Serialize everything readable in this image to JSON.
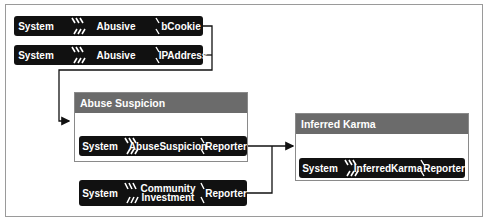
{
  "diagram": {
    "inputs": [
      {
        "context": "System",
        "claim": "Abusive",
        "target": "bCookie"
      },
      {
        "context": "System",
        "claim": "Abusive",
        "target": "IPAddress"
      }
    ],
    "groups": [
      {
        "title": "Abuse Suspicion",
        "block": {
          "context": "System",
          "claim": "AbuseSuspicion",
          "target": "Reporter"
        }
      },
      {
        "title": "Inferred Karma",
        "block": {
          "context": "System",
          "claim": "InferredKarma",
          "target": "Reporter"
        }
      }
    ],
    "community": {
      "context": "System",
      "claim_line1": "Community",
      "claim_line2": "Investment",
      "target": "Reporter"
    },
    "colors": {
      "block": "#111111",
      "header": "#6b6b6b",
      "line": "#111111",
      "frame": "#9a9a9a"
    }
  }
}
